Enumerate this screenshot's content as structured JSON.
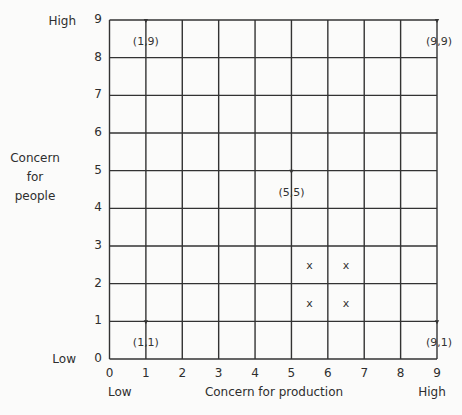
{
  "chart_data": {
    "type": "scatter",
    "title": "",
    "xlabel": "Concern for production",
    "ylabel": "Concern for people",
    "x_low_label": "Low",
    "x_high_label": "High",
    "y_low_label": "Low",
    "y_high_label": "High",
    "xlim": [
      0,
      9
    ],
    "ylim": [
      0,
      9
    ],
    "grid": true,
    "x_ticks": [
      "0",
      "1",
      "2",
      "3",
      "4",
      "5",
      "6",
      "7",
      "8",
      "9"
    ],
    "y_ticks": [
      "0",
      "1",
      "2",
      "3",
      "4",
      "5",
      "6",
      "7",
      "8",
      "9"
    ],
    "points": [
      {
        "x": 1,
        "y": 9,
        "label": "(1,9)"
      },
      {
        "x": 9,
        "y": 9,
        "label": "(9,9)"
      },
      {
        "x": 5,
        "y": 5,
        "label": "(5,5)"
      },
      {
        "x": 1,
        "y": 1,
        "label": "(1,1)"
      },
      {
        "x": 9,
        "y": 1,
        "label": "(9,1)"
      }
    ],
    "cell_marks": [
      {
        "x": 5.5,
        "y": 2.5,
        "label": "x"
      },
      {
        "x": 6.5,
        "y": 2.5,
        "label": "x"
      },
      {
        "x": 5.5,
        "y": 1.5,
        "label": "x"
      },
      {
        "x": 6.5,
        "y": 1.5,
        "label": "x"
      }
    ],
    "legend": null
  },
  "labels": {
    "y_axis_lines": [
      "Concern",
      "for",
      "people"
    ],
    "x_axis": "Concern for production",
    "x_low": "Low",
    "x_high": "High",
    "y_low": "Low",
    "y_high": "High"
  },
  "colors": {
    "background": "#fbfbfa",
    "grid": "#333333",
    "text": "#2e2e2e"
  }
}
